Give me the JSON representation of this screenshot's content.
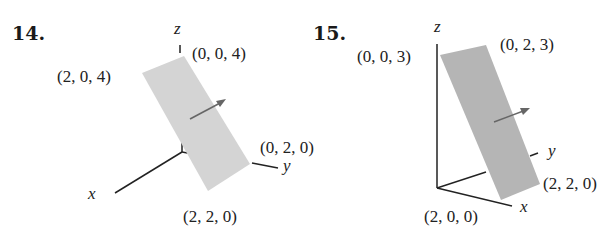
{
  "figures": [
    {
      "number": "14.",
      "axes": {
        "x": "x",
        "y": "y",
        "z": "z"
      },
      "vertices": [
        {
          "label": "(2, 0, 4)"
        },
        {
          "label": "(0, 0, 4)"
        },
        {
          "label": "(0, 2, 0)"
        },
        {
          "label": "(2, 2, 0)"
        }
      ],
      "plane_color": "#d4d4d4",
      "normal_arrow": true
    },
    {
      "number": "15.",
      "axes": {
        "x": "x",
        "y": "y",
        "z": "z"
      },
      "vertices": [
        {
          "label": "(0, 0, 3)"
        },
        {
          "label": "(0, 2, 3)"
        },
        {
          "label": "(2, 2, 0)"
        },
        {
          "label": "(2, 0, 0)"
        }
      ],
      "plane_color": "#b5b5b5",
      "normal_arrow": true
    }
  ]
}
